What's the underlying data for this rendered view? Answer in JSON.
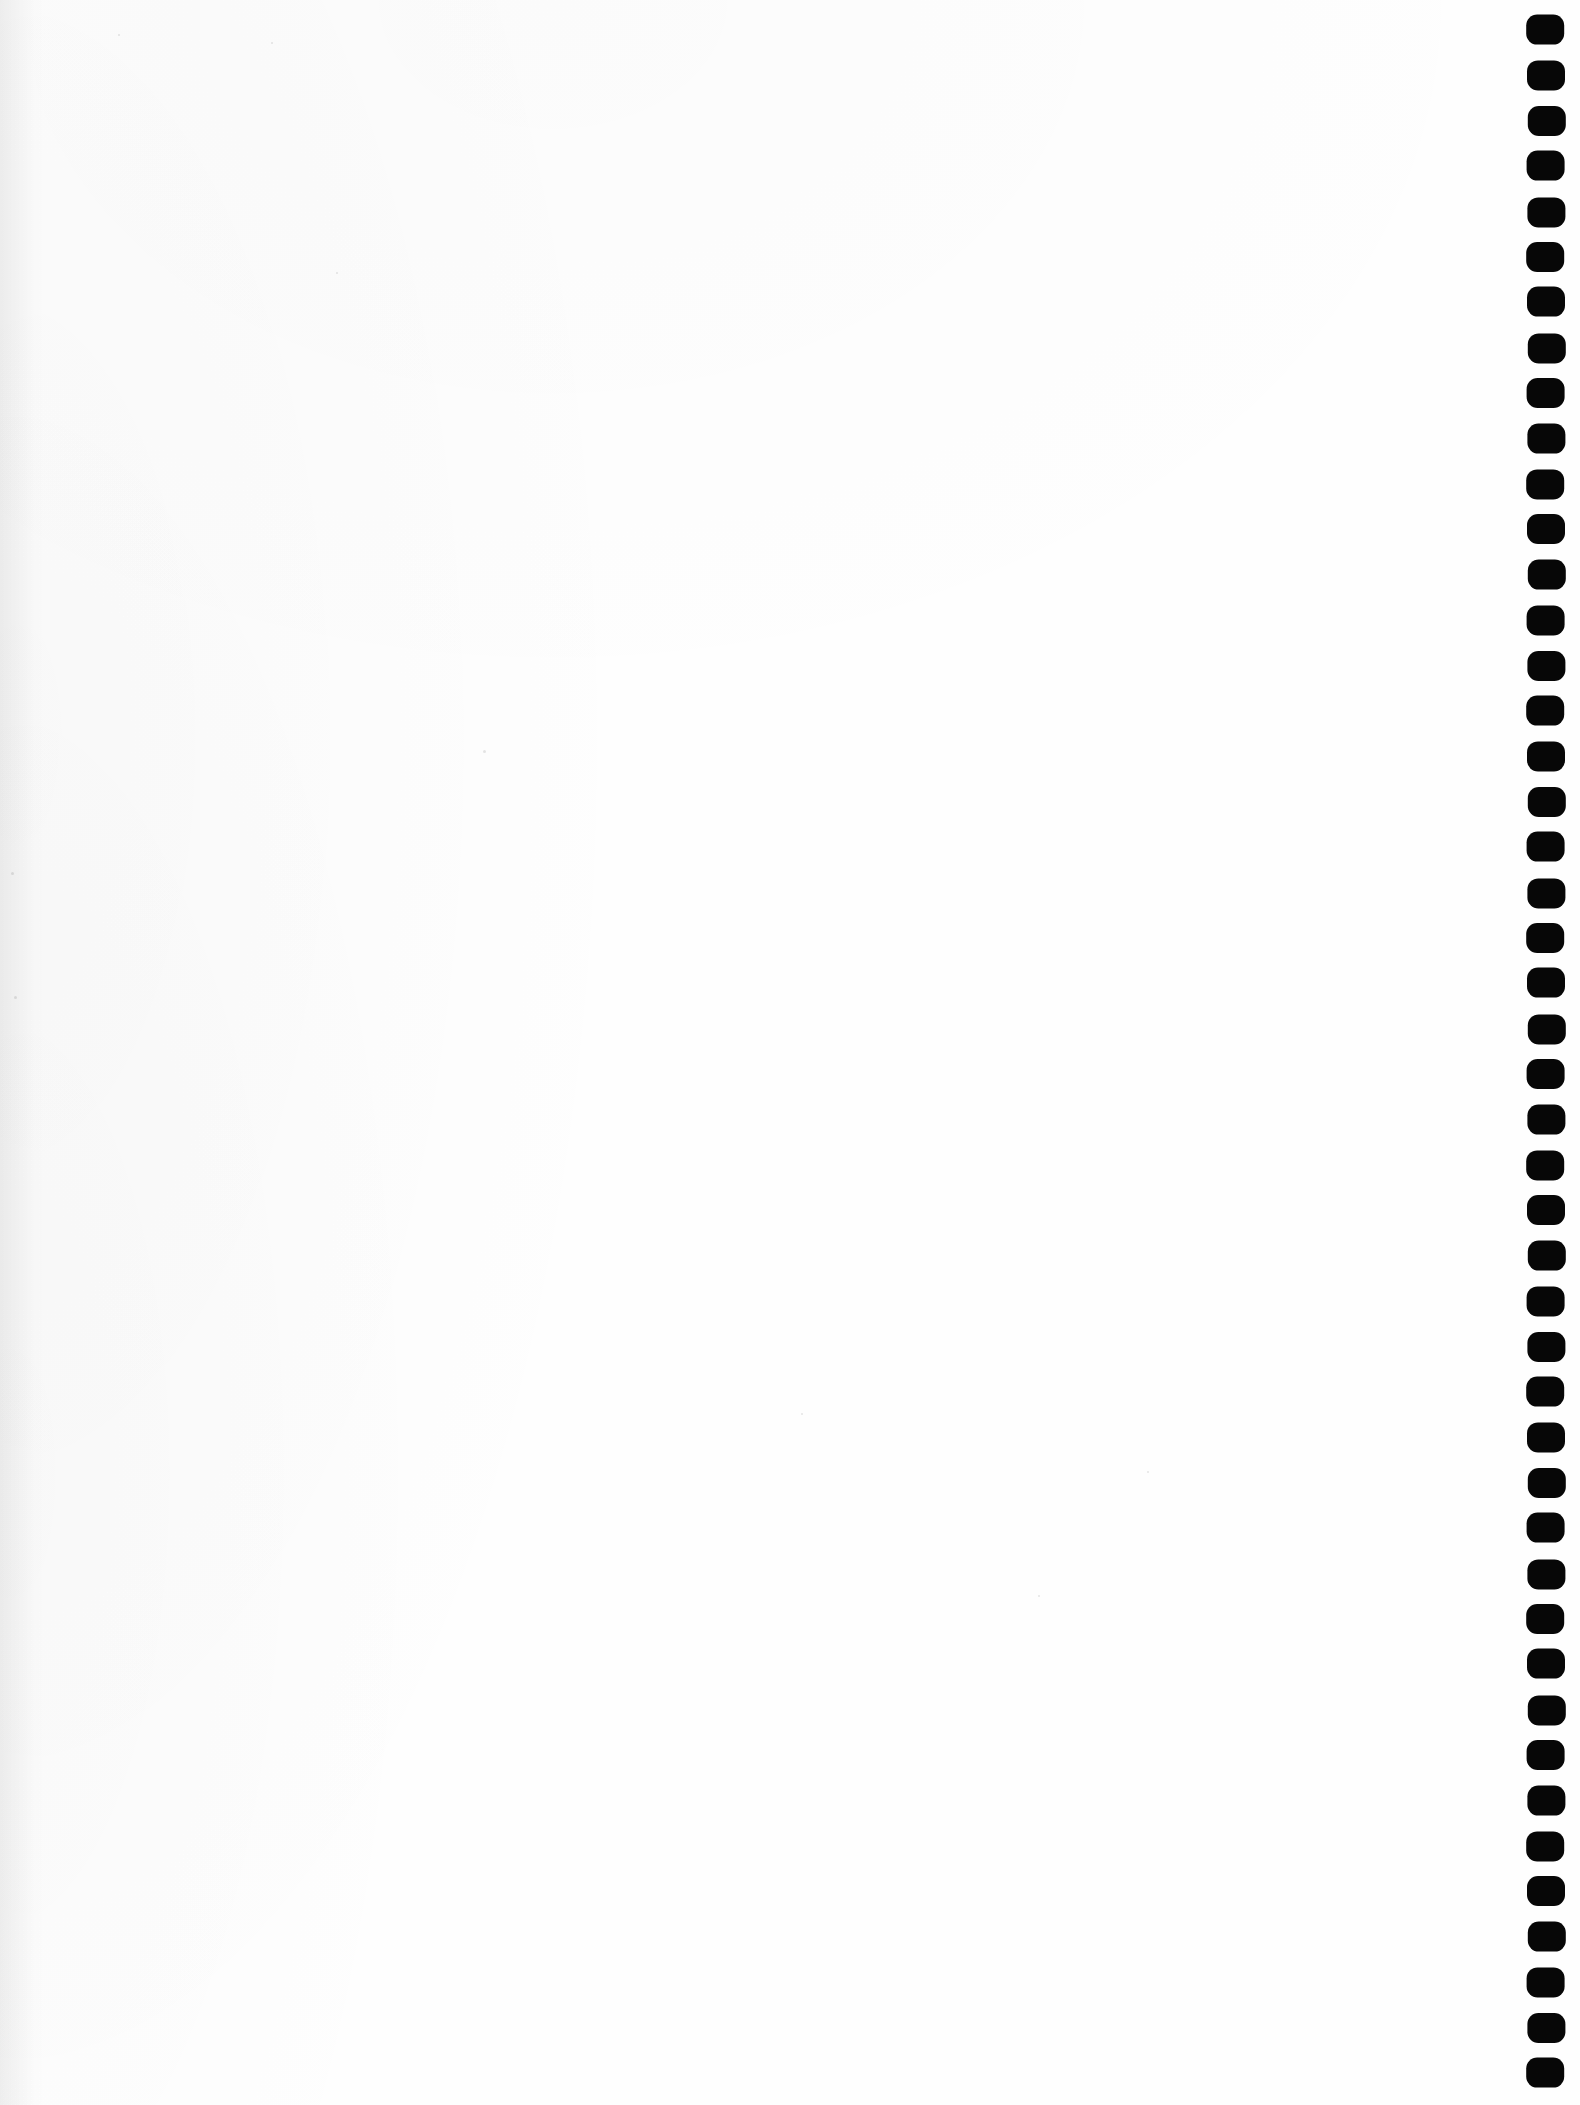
{
  "document": {
    "type": "scanned-page",
    "page_content": "",
    "body_text": "",
    "description": "Blank scanned document page",
    "width": 1580,
    "height": 2105,
    "background_color": "#fefefe",
    "ink_color": "#070707"
  },
  "binding_strip": {
    "name": "spiral-binding-marks",
    "mark_shape": "rounded-square",
    "mark_count": 46,
    "mark_width": 38,
    "mark_height": 30,
    "corner_radius": 11,
    "left_x": 1527,
    "first_mark_y": 15,
    "pitch": 45.4,
    "color": "#070707"
  },
  "specks": [
    {
      "x": 483,
      "y": 750,
      "size": 3
    },
    {
      "x": 118,
      "y": 34,
      "size": 2
    },
    {
      "x": 11,
      "y": 872,
      "size": 3
    },
    {
      "x": 14,
      "y": 996,
      "size": 3
    },
    {
      "x": 801,
      "y": 1413,
      "size": 2
    },
    {
      "x": 1147,
      "y": 1471,
      "size": 2
    },
    {
      "x": 1038,
      "y": 1595,
      "size": 2
    },
    {
      "x": 271,
      "y": 42,
      "size": 2
    },
    {
      "x": 336,
      "y": 272,
      "size": 2
    }
  ]
}
